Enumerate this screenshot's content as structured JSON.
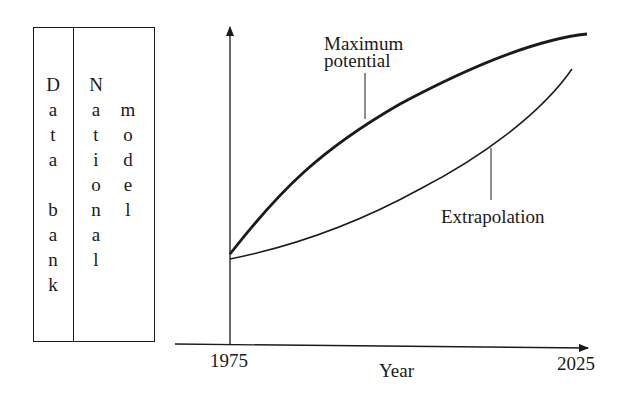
{
  "diagram": {
    "left_panel": {
      "columns": [
        {
          "name": "data-bank",
          "letters": [
            "D",
            "a",
            "t",
            "a",
            "",
            "b",
            "a",
            "n",
            "k"
          ]
        },
        {
          "name": "national",
          "letters": [
            "N",
            "a",
            "t",
            "i",
            "o",
            "n",
            "a",
            "l"
          ]
        },
        {
          "name": "model",
          "letters": [
            "m",
            "o",
            "d",
            "e",
            "l"
          ]
        }
      ],
      "text": [
        "Data bank",
        "National model"
      ]
    },
    "chart": {
      "x_axis_label": "Year",
      "x_start_label": "1975",
      "x_end_label": "2025",
      "curve_upper_label_line1": "Maximum",
      "curve_upper_label_line2": "potential",
      "curve_lower_label": "Extrapolation"
    }
  },
  "chart_data": {
    "type": "line",
    "title": "",
    "xlabel": "Year",
    "ylabel": "",
    "x_ticks": [
      "1975",
      "2025"
    ],
    "xlim": [
      1975,
      2025
    ],
    "grid": false,
    "series": [
      {
        "name": "Maximum potential",
        "style": "thick",
        "x": [
          1975,
          1985,
          1995,
          2005,
          2015,
          2025
        ],
        "y": [
          0.36,
          0.58,
          0.74,
          0.86,
          0.94,
          0.99
        ]
      },
      {
        "name": "Extrapolation",
        "style": "thin",
        "x": [
          1975,
          1985,
          1995,
          2005,
          2015,
          2025
        ],
        "y": [
          0.35,
          0.41,
          0.5,
          0.61,
          0.74,
          0.9
        ]
      }
    ],
    "annotations": [
      "Maximum potential",
      "Extrapolation"
    ]
  }
}
